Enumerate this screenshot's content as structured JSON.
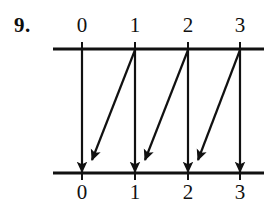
{
  "figure": {
    "problem_number": "9.",
    "type": "mapping-diagram",
    "background_color": "#ffffff",
    "ink_color": "#111111",
    "top_axis": {
      "name": "domain-axis",
      "y": 49,
      "x_start": 53,
      "x_end": 264,
      "labels": [
        "0",
        "1",
        "2",
        "3"
      ],
      "tick_x": [
        82,
        135,
        188,
        240
      ]
    },
    "bottom_axis": {
      "name": "codomain-axis",
      "y": 173,
      "x_start": 53,
      "x_end": 264,
      "labels": [
        "0",
        "1",
        "2",
        "3"
      ],
      "tick_x": [
        82,
        135,
        188,
        240
      ]
    },
    "arrows": [
      {
        "name": "arrow-0-to-0",
        "kind": "vertical",
        "from": "0",
        "to": "0",
        "x1": 82,
        "y1": 49,
        "x2": 82,
        "y2": 172
      },
      {
        "name": "arrow-1-to-1",
        "kind": "vertical",
        "from": "1",
        "to": "1",
        "x1": 135,
        "y1": 49,
        "x2": 135,
        "y2": 172
      },
      {
        "name": "arrow-2-to-2",
        "kind": "vertical",
        "from": "2",
        "to": "2",
        "x1": 188,
        "y1": 49,
        "x2": 188,
        "y2": 172
      },
      {
        "name": "arrow-3-to-3",
        "kind": "vertical",
        "from": "3",
        "to": "3",
        "x1": 240,
        "y1": 49,
        "x2": 240,
        "y2": 172
      },
      {
        "name": "arrow-1-to-0",
        "kind": "diagonal",
        "from": "1",
        "to": "0",
        "x1": 135,
        "y1": 50,
        "x2": 92,
        "y2": 160
      },
      {
        "name": "arrow-2-to-1",
        "kind": "diagonal",
        "from": "2",
        "to": "1",
        "x1": 188,
        "y1": 50,
        "x2": 145,
        "y2": 160
      },
      {
        "name": "arrow-3-to-2",
        "kind": "diagonal",
        "from": "3",
        "to": "2",
        "x1": 240,
        "y1": 50,
        "x2": 198,
        "y2": 160
      }
    ]
  }
}
